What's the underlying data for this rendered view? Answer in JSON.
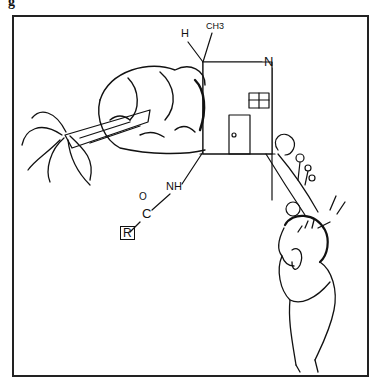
{
  "figure": {
    "corner_label": "g",
    "colors": {
      "ink": "#111111",
      "background": "#ffffff",
      "frame": "#222222"
    }
  },
  "chemistry": {
    "top_substituent_h": "H",
    "top_substituent_ch3": "CH3",
    "right_atom": "N",
    "amide_nh": "NH",
    "carbonyl_o": "O",
    "carbonyl_c": "C",
    "r_group": "R"
  },
  "scene": {
    "elements": [
      "fallen-tree",
      "bushes",
      "house",
      "window",
      "door",
      "path",
      "flowers",
      "ball",
      "worried-man"
    ]
  }
}
